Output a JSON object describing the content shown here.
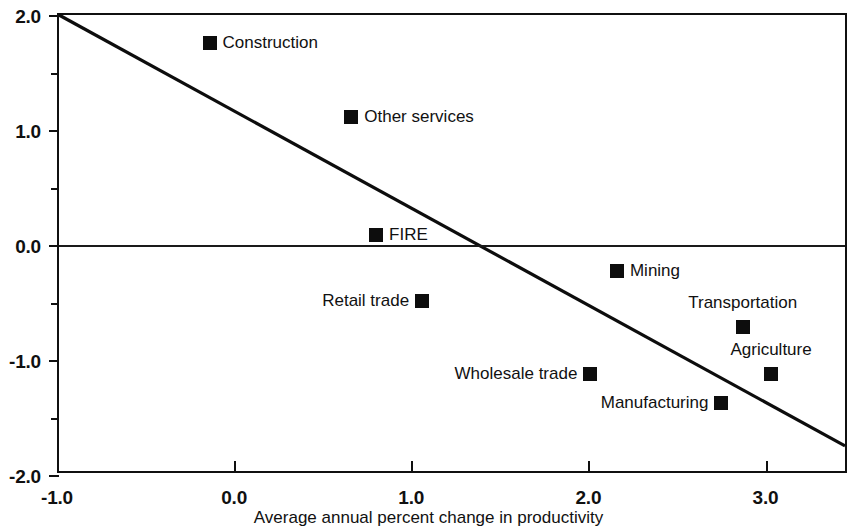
{
  "chart_data": {
    "type": "scatter",
    "title": "",
    "xlabel": "Average annual percent change in productivity",
    "ylabel": "",
    "xlim": [
      -1.0,
      3.46
    ],
    "ylim": [
      -2.0,
      2.0
    ],
    "grid": false,
    "legend": "none",
    "x_ticks": [
      "-1.0",
      "0.0",
      "1.0",
      "2.0",
      "3.0"
    ],
    "x_tick_values": [
      -1.0,
      0.0,
      1.0,
      2.0,
      3.0
    ],
    "y_ticks": [
      "2.0",
      "1.0",
      "0.0",
      "-1.0",
      "-2.0"
    ],
    "y_tick_values": [
      2.0,
      1.0,
      0.0,
      -1.0,
      -2.0
    ],
    "y_minor_tick_values": [
      1.5,
      0.5,
      -0.5,
      -1.5
    ],
    "zero_line": 0.0,
    "marker": "filled-square",
    "marker_color": "#0d0d0d",
    "points": [
      {
        "label": "Construction",
        "x": -0.15,
        "y": 1.76,
        "label_pos": "right"
      },
      {
        "label": "Other services",
        "x": 0.65,
        "y": 1.11,
        "label_pos": "right"
      },
      {
        "label": "FIRE",
        "x": 0.79,
        "y": 0.09,
        "label_pos": "right"
      },
      {
        "label": "Mining",
        "x": 2.15,
        "y": -0.23,
        "label_pos": "right"
      },
      {
        "label": "Retail trade",
        "x": 1.05,
        "y": -0.49,
        "label_pos": "left"
      },
      {
        "label": "Transportation",
        "x": 2.86,
        "y": -0.71,
        "label_pos": "above"
      },
      {
        "label": "Wholesale trade",
        "x": 2.0,
        "y": -1.12,
        "label_pos": "left"
      },
      {
        "label": "Agriculture",
        "x": 3.02,
        "y": -1.12,
        "label_pos": "above"
      },
      {
        "label": "Manufacturing",
        "x": 2.74,
        "y": -1.37,
        "label_pos": "left"
      }
    ],
    "trend_line": {
      "x_start": -1.0,
      "y_start": 2.0,
      "x_end": 3.46,
      "y_end": -1.78,
      "color": "#0d0d0d"
    }
  }
}
